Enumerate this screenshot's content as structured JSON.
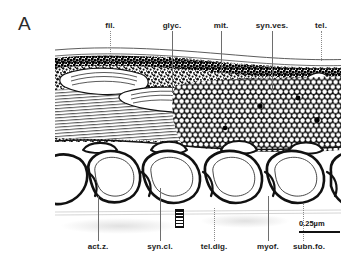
{
  "figure": {
    "panel_letter": "A",
    "type": "electron-micrograph-line-drawing"
  },
  "labels_top": [
    {
      "text": "fil.",
      "x": 110,
      "leader_x": 110,
      "leader_top": 31,
      "leader_height": 33,
      "leader_style": "dotted"
    },
    {
      "text": "glyc.",
      "x": 172,
      "leader_x": 172,
      "leader_top": 31,
      "leader_height": 62,
      "leader_style": "solid"
    },
    {
      "text": "mit.",
      "x": 221,
      "leader_x": 221,
      "leader_top": 31,
      "leader_height": 42,
      "leader_style": "solid"
    },
    {
      "text": "syn.ves.",
      "x": 272,
      "leader_x": 272,
      "leader_top": 31,
      "leader_height": 62,
      "leader_style": "solid"
    },
    {
      "text": "tel.",
      "x": 321,
      "leader_x": 321,
      "leader_top": 31,
      "leader_height": 30,
      "leader_style": "dotted"
    }
  ],
  "labels_bottom": [
    {
      "text": "act.z.",
      "x": 98,
      "leader_x": 98,
      "leader_top": 196,
      "leader_height": 45,
      "leader_style": "solid"
    },
    {
      "text": "syn.cl.",
      "x": 160,
      "leader_x": 160,
      "leader_top": 188,
      "leader_height": 53,
      "leader_style": "solid"
    },
    {
      "text": "tel.dig.",
      "x": 214,
      "leader_x": 214,
      "leader_top": 208,
      "leader_height": 33,
      "leader_style": "dotted"
    },
    {
      "text": "myof.",
      "x": 268,
      "leader_x": 268,
      "leader_top": 196,
      "leader_height": 45,
      "leader_style": "solid"
    },
    {
      "text": "subn.fo.",
      "x": 309,
      "leader_x": 303,
      "leader_top": 204,
      "leader_height": 37,
      "leader_style": "dotted"
    }
  ],
  "scale_bar": {
    "text": "0.25µm",
    "length_px": 41
  },
  "colors": {
    "ink": "#111111",
    "leader": "#6e6e6e",
    "background": "#ffffff"
  }
}
